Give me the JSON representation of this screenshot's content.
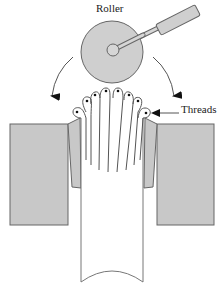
{
  "diagram": {
    "labels": {
      "roller": "Roller",
      "threads": "Threads"
    },
    "components": [
      "roller-disc",
      "roller-hub",
      "roller-handle",
      "left-rotation-arrow",
      "right-rotation-arrow",
      "left-die-block",
      "right-die-block",
      "left-die-lip",
      "right-die-lip",
      "tube",
      "thread-loops"
    ],
    "thread_count": 8,
    "colors": {
      "die_fill": "#c8c8c8",
      "roller_fill": "#cfcfcf",
      "stroke": "#555555",
      "tube_fill": "#ffffff",
      "arrow": "#111111"
    }
  }
}
